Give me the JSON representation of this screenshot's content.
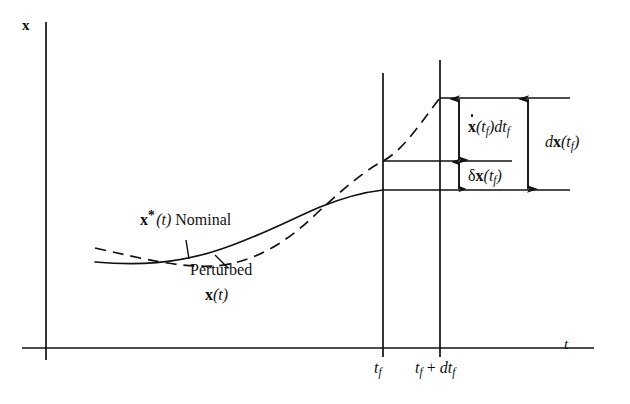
{
  "figure": {
    "axes": {
      "y_label": "x",
      "x_label": "t",
      "x_ticks": [
        {
          "name": "tf",
          "label_main": "t",
          "label_sub": "f"
        },
        {
          "name": "tf-plus-dtf",
          "label_main": "t",
          "label_sub": "f",
          "label_tail": " + ",
          "label_d": "dt",
          "label_d_sub": "f"
        }
      ]
    },
    "curves": {
      "nominal": {
        "style": "solid",
        "label_symbol": "x",
        "label_star": "*",
        "label_arg": "(t)",
        "label_text": "Nominal"
      },
      "perturbed": {
        "style": "dashed",
        "label_text": "Perturbed",
        "label_symbol": "x",
        "label_arg": "(t)"
      }
    },
    "annotations": [
      {
        "name": "xdot-dtf",
        "symbol_dot": "x",
        "arg": "(t",
        "arg_sub": "f",
        "arg_close": ")",
        "term": "dt",
        "term_sub": "f"
      },
      {
        "name": "delta-x-tf",
        "delta": "δ",
        "symbol": "x",
        "arg": "(t",
        "arg_sub": "f",
        "arg_close": ")"
      },
      {
        "name": "dx-tf",
        "d": "d",
        "symbol": "x",
        "arg": "(t",
        "arg_sub": "f",
        "arg_close": ")"
      }
    ],
    "colors": {
      "ink": "#111111",
      "background": "#ffffff"
    }
  }
}
